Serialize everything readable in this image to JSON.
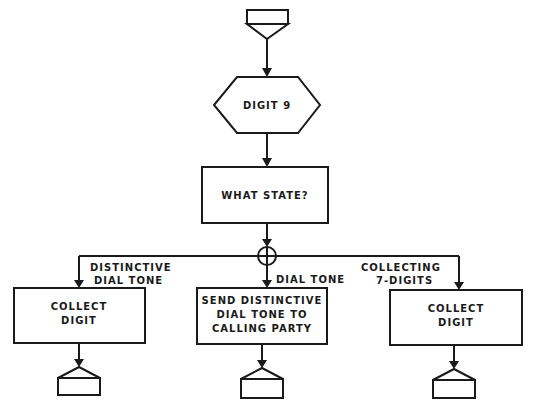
{
  "diagram": {
    "type": "flowchart",
    "entry_connector": {
      "shape": "off-page-connector",
      "direction": "in"
    },
    "decision_start": {
      "shape": "hexagon",
      "label": "DIGIT 9"
    },
    "state_box": {
      "shape": "rectangle",
      "label": "WHAT STATE?"
    },
    "junction": {
      "shape": "circle-cross"
    },
    "branches": [
      {
        "condition_line1": "DISTINCTIVE",
        "condition_line2": "DIAL TONE",
        "action_line1": "COLLECT",
        "action_line2": "DIGIT",
        "action_line3": ""
      },
      {
        "condition_line1": "DIAL TONE",
        "condition_line2": "",
        "action_line1": "SEND DISTINCTIVE",
        "action_line2": "DIAL TONE TO",
        "action_line3": "CALLING PARTY"
      },
      {
        "condition_line1": "COLLECTING",
        "condition_line2": "7-DIGITS",
        "action_line1": "COLLECT",
        "action_line2": "DIGIT",
        "action_line3": ""
      }
    ],
    "exit_connectors": [
      {
        "shape": "off-page-connector",
        "direction": "out"
      },
      {
        "shape": "off-page-connector",
        "direction": "out"
      },
      {
        "shape": "off-page-connector",
        "direction": "out"
      }
    ]
  },
  "colors": {
    "line": "#1a1a1a",
    "background": "#ffffff"
  }
}
